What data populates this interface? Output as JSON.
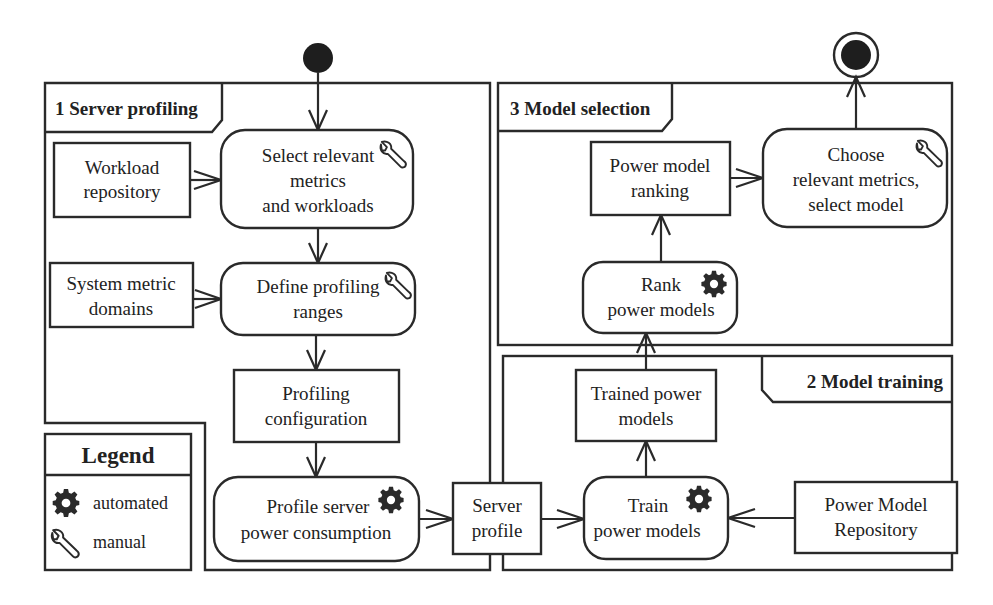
{
  "diagram": {
    "type": "UML activity diagram",
    "colors": {
      "stroke": "#2a2a2a",
      "text": "#222222",
      "background": "#ffffff"
    },
    "partitions": [
      {
        "id": "p1",
        "label": "1 Server profiling"
      },
      {
        "id": "p2",
        "label": "2 Model training"
      },
      {
        "id": "p3",
        "label": "3 Model selection"
      }
    ],
    "nodes": {
      "workload_repository": {
        "kind": "object",
        "lines": [
          "Workload",
          "repository"
        ]
      },
      "select_metrics": {
        "kind": "action",
        "icon": "wrench-icon",
        "lines": [
          "Select relevant",
          "metrics",
          "and workloads"
        ]
      },
      "system_metric_domains": {
        "kind": "object",
        "lines": [
          "System metric",
          "domains"
        ]
      },
      "define_ranges": {
        "kind": "action",
        "icon": "wrench-icon",
        "lines": [
          "Define profiling",
          "ranges"
        ]
      },
      "profiling_configuration": {
        "kind": "object",
        "lines": [
          "Profiling",
          "configuration"
        ]
      },
      "profile_server": {
        "kind": "action",
        "icon": "gear-icon",
        "lines": [
          "Profile server",
          "power consumption"
        ]
      },
      "server_profile": {
        "kind": "object",
        "lines": [
          "Server",
          "profile"
        ]
      },
      "train_models": {
        "kind": "action",
        "icon": "gear-icon",
        "lines": [
          "Train",
          "power models"
        ]
      },
      "power_model_repository": {
        "kind": "object",
        "lines": [
          "Power Model",
          "Repository"
        ]
      },
      "trained_models": {
        "kind": "object",
        "lines": [
          "Trained power",
          "models"
        ]
      },
      "rank_models": {
        "kind": "action",
        "icon": "gear-icon",
        "lines": [
          "Rank",
          "power models"
        ]
      },
      "model_ranking": {
        "kind": "object",
        "lines": [
          "Power model",
          "ranking"
        ]
      },
      "choose_model": {
        "kind": "action",
        "icon": "wrench-icon",
        "lines": [
          "Choose",
          "relevant metrics,",
          "select model"
        ]
      }
    },
    "edges": [
      {
        "from": "initial",
        "to": "select_metrics"
      },
      {
        "from": "workload_repository",
        "to": "select_metrics"
      },
      {
        "from": "select_metrics",
        "to": "define_ranges"
      },
      {
        "from": "system_metric_domains",
        "to": "define_ranges"
      },
      {
        "from": "define_ranges",
        "to": "profiling_configuration"
      },
      {
        "from": "profiling_configuration",
        "to": "profile_server"
      },
      {
        "from": "profile_server",
        "to": "server_profile"
      },
      {
        "from": "server_profile",
        "to": "train_models"
      },
      {
        "from": "power_model_repository",
        "to": "train_models"
      },
      {
        "from": "train_models",
        "to": "trained_models"
      },
      {
        "from": "trained_models",
        "to": "rank_models"
      },
      {
        "from": "rank_models",
        "to": "model_ranking"
      },
      {
        "from": "model_ranking",
        "to": "choose_model"
      },
      {
        "from": "choose_model",
        "to": "final"
      }
    ],
    "legend": {
      "title": "Legend",
      "items": [
        {
          "icon": "gear-icon",
          "label": "automated"
        },
        {
          "icon": "wrench-icon",
          "label": "manual"
        }
      ]
    }
  }
}
